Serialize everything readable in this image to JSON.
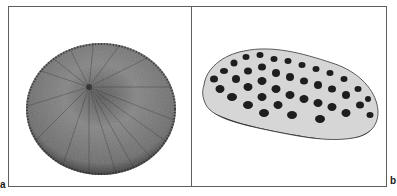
{
  "figure": {
    "panels": [
      {
        "id": "a",
        "label": "a",
        "subject": "disc-shaped specimen with radiating ridges (top view)",
        "icon": "specimen-disc-image"
      },
      {
        "id": "b",
        "label": "b",
        "subject": "elongated specimen with dark spotted surface (side view)",
        "icon": "specimen-spotted-image"
      }
    ],
    "colors": {
      "frame": "#5e5e5e",
      "background": "#ffffff",
      "specimen_a_base": "#7a7a7a",
      "specimen_b_base": "#d8d8d8",
      "specimen_b_spots": "#1e1e1e"
    }
  }
}
